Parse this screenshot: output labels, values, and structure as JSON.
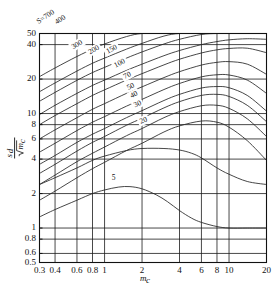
{
  "chart_data": {
    "type": "line",
    "title": "",
    "xlabel": "m_c",
    "ylabel": "s_d/√m_c",
    "xscale": "log",
    "yscale": "log",
    "xlim": [
      0.3,
      20
    ],
    "ylim": [
      0.5,
      50
    ],
    "grid": true,
    "legend_position": "inline-curve-labels",
    "xticks": [
      "0.3",
      "0.4",
      "0.6",
      "0.8",
      "1",
      "2",
      "4",
      "6",
      "8",
      "10",
      "20"
    ],
    "xtick_values": [
      0.3,
      0.4,
      0.6,
      0.8,
      1,
      2,
      4,
      6,
      8,
      10,
      20
    ],
    "yticks": [
      "0.5",
      "0.6",
      "0.8",
      "1",
      "2",
      "4",
      "6",
      "8",
      "10",
      "20",
      "40",
      "50"
    ],
    "ytick_values": [
      0.5,
      0.6,
      0.8,
      1,
      2,
      4,
      6,
      8,
      10,
      20,
      40,
      50
    ],
    "series_parameter_name": "S",
    "series": [
      {
        "name": "700",
        "label": "S=700",
        "x": [
          0.3,
          0.4,
          0.6,
          0.8,
          1,
          1.5,
          2,
          3,
          4,
          6,
          8,
          10,
          14,
          20
        ],
        "y": [
          21.0,
          25.0,
          31.5,
          36.5,
          40.5,
          47.0,
          50.0,
          50.0,
          50.0,
          50.0,
          50.0,
          50.0,
          50.0,
          50.0
        ]
      },
      {
        "name": "400",
        "label": "400",
        "x": [
          0.3,
          0.4,
          0.6,
          0.8,
          1,
          1.5,
          2,
          3,
          4,
          6,
          8,
          10,
          14,
          20
        ],
        "y": [
          15.5,
          18.5,
          23.5,
          27.5,
          30.5,
          36.5,
          41.0,
          47.5,
          50.0,
          50.0,
          50.0,
          50.0,
          50.0,
          50.0
        ]
      },
      {
        "name": "300",
        "label": "300",
        "x": [
          0.3,
          0.4,
          0.6,
          0.8,
          1,
          1.5,
          2,
          3,
          4,
          6,
          8,
          10,
          14,
          20
        ],
        "y": [
          12.8,
          15.3,
          19.5,
          22.8,
          25.3,
          30.5,
          34.5,
          40.5,
          44.5,
          49.0,
          50.0,
          50.0,
          50.0,
          50.0
        ]
      },
      {
        "name": "200",
        "label": "200",
        "x": [
          0.3,
          0.4,
          0.6,
          0.8,
          1,
          1.5,
          2,
          3,
          4,
          6,
          8,
          10,
          14,
          20
        ],
        "y": [
          9.8,
          11.8,
          15.0,
          17.6,
          19.6,
          23.8,
          27.0,
          32.0,
          35.5,
          40.0,
          42.5,
          44.0,
          45.0,
          44.5
        ]
      },
      {
        "name": "150",
        "label": "150",
        "x": [
          0.3,
          0.4,
          0.6,
          0.8,
          1,
          1.5,
          2,
          3,
          4,
          6,
          8,
          10,
          14,
          20
        ],
        "y": [
          8.0,
          9.6,
          12.2,
          14.4,
          16.1,
          19.6,
          22.3,
          26.6,
          29.8,
          33.8,
          36.0,
          37.0,
          37.2,
          34.0
        ]
      },
      {
        "name": "100",
        "label": "100",
        "x": [
          0.3,
          0.4,
          0.6,
          0.8,
          1,
          1.5,
          2,
          3,
          4,
          6,
          8,
          10,
          14,
          20
        ],
        "y": [
          6.0,
          7.2,
          9.2,
          10.9,
          12.2,
          15.0,
          17.1,
          20.6,
          23.2,
          26.5,
          28.0,
          28.4,
          27.0,
          22.0
        ]
      },
      {
        "name": "70",
        "label": "70",
        "x": [
          0.3,
          0.4,
          0.6,
          0.8,
          1,
          1.5,
          2,
          3,
          4,
          6,
          8,
          10,
          14,
          20
        ],
        "y": [
          4.6,
          5.5,
          7.1,
          8.4,
          9.4,
          11.6,
          13.3,
          16.2,
          18.3,
          20.9,
          21.8,
          21.7,
          19.6,
          15.0
        ]
      },
      {
        "name": "50",
        "label": "50",
        "x": [
          0.3,
          0.4,
          0.6,
          0.8,
          1,
          1.5,
          2,
          3,
          4,
          6,
          8,
          10,
          14,
          20
        ],
        "y": [
          3.6,
          4.3,
          5.6,
          6.6,
          7.4,
          9.2,
          10.6,
          13.0,
          14.7,
          16.7,
          17.2,
          16.8,
          14.4,
          10.5
        ]
      },
      {
        "name": "40",
        "label": "40",
        "x": [
          0.3,
          0.4,
          0.6,
          0.8,
          1,
          1.5,
          2,
          3,
          4,
          6,
          8,
          10,
          14,
          20
        ],
        "y": [
          3.0,
          3.6,
          4.7,
          5.6,
          6.3,
          7.9,
          9.1,
          11.2,
          12.7,
          14.4,
          14.7,
          14.1,
          11.8,
          8.5
        ]
      },
      {
        "name": "30",
        "label": "30",
        "x": [
          0.3,
          0.4,
          0.6,
          0.8,
          1,
          1.5,
          2,
          3,
          4,
          6,
          8,
          10,
          14,
          20
        ],
        "y": [
          2.4,
          2.9,
          3.8,
          4.5,
          5.1,
          6.4,
          7.4,
          9.2,
          10.4,
          11.7,
          11.8,
          11.1,
          9.0,
          6.3
        ]
      },
      {
        "name": "20",
        "label": "20",
        "x": [
          0.3,
          0.4,
          0.6,
          0.8,
          1,
          1.5,
          2,
          3,
          4,
          6,
          8,
          10,
          14,
          20
        ],
        "y": [
          1.75,
          2.1,
          2.75,
          3.3,
          3.75,
          4.75,
          5.5,
          6.9,
          7.8,
          8.6,
          8.4,
          7.6,
          5.8,
          3.9
        ]
      },
      {
        "name": "10",
        "label": "",
        "x": [
          0.3,
          0.4,
          0.6,
          0.8,
          1,
          1.5,
          2,
          3,
          4,
          5,
          6,
          8,
          10,
          14,
          20
        ],
        "y": [
          2.4,
          2.75,
          3.35,
          3.9,
          4.25,
          4.75,
          4.95,
          4.95,
          4.8,
          4.5,
          4.1,
          3.35,
          2.95,
          2.55,
          2.4
        ]
      },
      {
        "name": "5",
        "label": "5",
        "x": [
          0.3,
          0.4,
          0.6,
          0.8,
          1,
          1.3,
          1.6,
          2,
          2.6,
          3.2,
          4,
          5,
          6,
          8,
          10,
          14,
          20
        ],
        "y": [
          1.25,
          1.45,
          1.75,
          2.0,
          2.15,
          2.28,
          2.3,
          2.2,
          1.95,
          1.7,
          1.42,
          1.22,
          1.12,
          1.03,
          1.0,
          1.0,
          1.0
        ]
      }
    ],
    "curve_label_positions": [
      {
        "text": "S=700",
        "x": 0.335,
        "y": 70.0,
        "rotate": -34
      },
      {
        "text": "400",
        "x": 0.44,
        "y": 66.0,
        "rotate": -34
      },
      {
        "text": "300",
        "x": 0.6,
        "y": 40.0,
        "rotate": -31
      },
      {
        "text": "200",
        "x": 0.82,
        "y": 36.0,
        "rotate": -30
      },
      {
        "text": "150",
        "x": 1.14,
        "y": 36.5,
        "rotate": -28
      },
      {
        "text": "100",
        "x": 1.32,
        "y": 27.5,
        "rotate": -28
      },
      {
        "text": "70",
        "x": 1.52,
        "y": 21.5,
        "rotate": -27
      },
      {
        "text": "50",
        "x": 1.62,
        "y": 17.2,
        "rotate": -26
      },
      {
        "text": "40",
        "x": 1.72,
        "y": 14.6,
        "rotate": -26
      },
      {
        "text": "30",
        "x": 1.84,
        "y": 12.1,
        "rotate": -25
      },
      {
        "text": "20",
        "x": 2.05,
        "y": 8.7,
        "rotate": -22
      },
      {
        "text": "5",
        "x": 1.18,
        "y": 2.72,
        "rotate": 0
      }
    ]
  },
  "axes": {
    "x_title": "m",
    "x_title_sub": "c",
    "y_title_num": "s",
    "y_title_num_sub": "d",
    "y_title_den": "m",
    "y_title_den_sub": "c"
  }
}
